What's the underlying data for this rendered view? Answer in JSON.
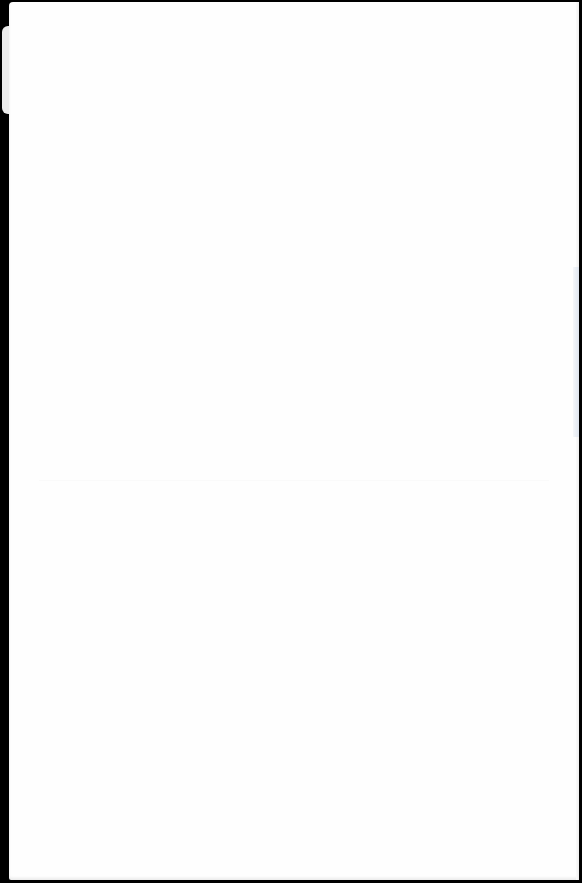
{
  "document": {
    "type": "blank-page",
    "text": ""
  },
  "colors": {
    "background": "#000000",
    "page": "#fefefe",
    "tab": "#ececec",
    "edge_tint": "#dfe5ee"
  }
}
